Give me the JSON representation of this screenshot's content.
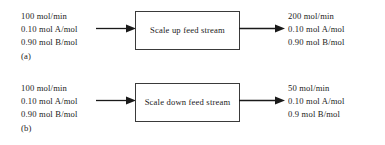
{
  "figure": {
    "background_color": "#ffffff",
    "text_color": "#1a1a1a",
    "box_border_color": "#3a3a3a",
    "arrow_color": "#1a1a1a"
  },
  "diagrams": [
    {
      "id": "a",
      "caption": "(a)",
      "feed": {
        "flow": "100 mol/min",
        "composition_a": "0.10 mol A/mol",
        "composition_b": "0.90 mol B/mol"
      },
      "process": {
        "label": "Scale up feed stream"
      },
      "product": {
        "flow": "200 mol/min",
        "composition_a": "0.10 mol A/mol",
        "composition_b": "0.90 mol B/mol"
      },
      "arrow_in": "arrow-right-icon",
      "arrow_out": "arrow-right-icon"
    },
    {
      "id": "b",
      "caption": "(b)",
      "feed": {
        "flow": "100 mol/min",
        "composition_a": "0.10 mol A/mol",
        "composition_b": "0.90 mol B/mol"
      },
      "process": {
        "label": "Scale down feed stream"
      },
      "product": {
        "flow": "50 mol/min",
        "composition_a": "0.10 mol A/mol",
        "composition_b": "0.9 mol B/mol"
      },
      "arrow_in": "arrow-right-icon",
      "arrow_out": "arrow-right-icon"
    }
  ]
}
